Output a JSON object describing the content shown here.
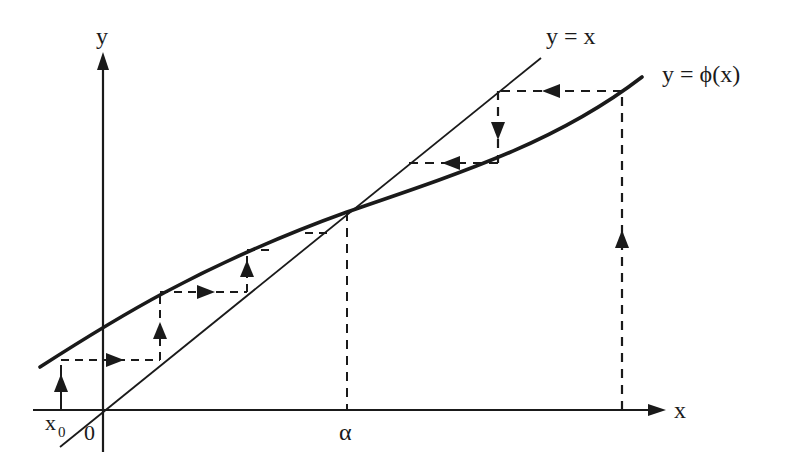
{
  "diagram": {
    "type": "cobweb fixed-point iteration diagram",
    "colors": {
      "ink": "#1a1a1a",
      "background": "#ffffff"
    },
    "axes": {
      "x_label": "x",
      "y_label": "y",
      "origin_label": "0"
    },
    "curves": {
      "identity_label": "y = x",
      "phi_label": "y = ϕ(x)"
    },
    "points": {
      "start_label": "x",
      "start_subscript": "0",
      "fixed_point_label": "α"
    },
    "left_cobweb": {
      "description": "iteration from x0 converging upward toward alpha",
      "arrow_directions": [
        "up",
        "right",
        "up",
        "right",
        "up"
      ]
    },
    "right_cobweb": {
      "description": "iteration from right start point converging downward toward alpha",
      "arrow_directions": [
        "up",
        "left",
        "down",
        "left"
      ]
    }
  }
}
